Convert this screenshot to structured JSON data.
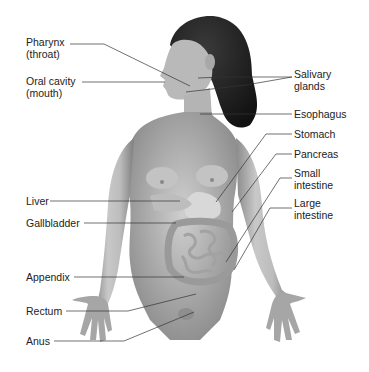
{
  "diagram": {
    "labels_left": [
      {
        "id": "pharynx",
        "text": "Pharynx\n(throat)",
        "x": 26,
        "y": 36
      },
      {
        "id": "oral-cavity",
        "text": "Oral cavity\n(mouth)",
        "x": 26,
        "y": 75
      },
      {
        "id": "liver",
        "text": "Liver",
        "x": 26,
        "y": 195
      },
      {
        "id": "gallbladder",
        "text": "Gallbladder",
        "x": 26,
        "y": 217
      },
      {
        "id": "appendix",
        "text": "Appendix",
        "x": 26,
        "y": 271
      },
      {
        "id": "rectum",
        "text": "Rectum",
        "x": 26,
        "y": 305
      },
      {
        "id": "anus",
        "text": "Anus",
        "x": 26,
        "y": 335
      }
    ],
    "labels_right": [
      {
        "id": "salivary-glands",
        "text": "Salivary\nglands",
        "x": 294,
        "y": 68
      },
      {
        "id": "esophagus",
        "text": "Esophagus",
        "x": 294,
        "y": 109
      },
      {
        "id": "stomach",
        "text": "Stomach",
        "x": 294,
        "y": 128
      },
      {
        "id": "pancreas",
        "text": "Pancreas",
        "x": 294,
        "y": 148
      },
      {
        "id": "small-intestine",
        "text": "Small\nintestine",
        "x": 294,
        "y": 167
      },
      {
        "id": "large-intestine",
        "text": "Large\nintestine",
        "x": 294,
        "y": 197
      }
    ]
  }
}
